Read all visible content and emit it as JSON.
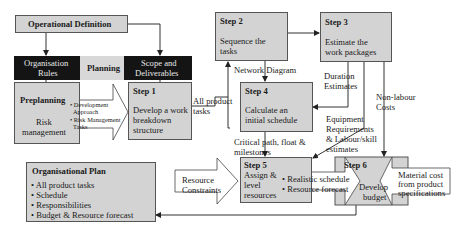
{
  "operational_definition": {
    "title": "Operational Definition"
  },
  "band": {
    "left": [
      "Organisation",
      "Rules"
    ],
    "middle": "Planning",
    "right": [
      "Scope and",
      "Deliverables"
    ]
  },
  "preplanning": {
    "title": "Preplanning",
    "body": [
      "Risk",
      "management"
    ]
  },
  "preplanning_callout": {
    "items": [
      "• Development",
      "  Approach",
      "• Risk Management",
      "  Tasks"
    ]
  },
  "steps": [
    {
      "title": "Step 1",
      "body": [
        "Develop a work",
        "breakdown",
        "structure"
      ]
    },
    {
      "title": "Step 2",
      "body": [
        "Sequence the",
        "tasks"
      ]
    },
    {
      "title": "Step 3",
      "body": [
        "Estimate the",
        "work packages"
      ]
    },
    {
      "title": "Step 4",
      "body": [
        "Calculate an",
        "initial schedule"
      ]
    },
    {
      "title": "Step 5",
      "body": [
        "Assign &",
        "level",
        "resources"
      ]
    },
    {
      "title": "Step 6",
      "body": [
        "Develop",
        "budget"
      ]
    }
  ],
  "edge_labels": {
    "all_product_tasks": [
      "All product",
      "tasks"
    ],
    "network_diagram": "Network Diagram",
    "duration_estimates": [
      "Duration",
      "Estimates"
    ],
    "non_labour_costs": [
      "Non-labour",
      "Costs"
    ],
    "equipment": [
      "Equipment",
      "Requirements",
      "& Labour/skill",
      "estimates"
    ],
    "critical_path": [
      "Critical path, float &",
      "milestones"
    ]
  },
  "resource_constraints": [
    "Resource",
    "Constraints"
  ],
  "step5_output": [
    "• Realistic schedule",
    "• Resource forecast"
  ],
  "material_cost": [
    "Material cost",
    "from product",
    "specifications"
  ],
  "organisational_plan": {
    "title": "Organisational Plan",
    "items": [
      "• All product tasks",
      "• Schedule",
      "• Responsibilities",
      "• Budget & Resource forecast"
    ]
  },
  "colors": {
    "box_fill": "#d3d3d3",
    "band_dark": "#141414",
    "line": "#333333"
  }
}
